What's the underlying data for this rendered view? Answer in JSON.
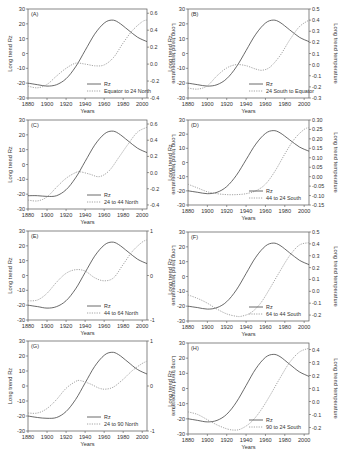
{
  "figure": {
    "x_label": "Years",
    "left_axis_label": "Long trend Rz",
    "right_axis_label": "Long trend temperature",
    "rz_legend": "Rz"
  },
  "colors": {
    "axis": "#555555",
    "rz_line": "#444444",
    "temp_line": "#9a9a9a",
    "text": "#333333"
  },
  "chart_data": [
    {
      "panel": "(A)",
      "type": "line",
      "title": "",
      "region": "Equator to 24 North",
      "xlabel": "Years",
      "ylabel": "Long trend Rz",
      "y2label": "Long trend temperature",
      "x_ticks": [
        1880,
        1900,
        1920,
        1940,
        1960,
        1980,
        2000
      ],
      "xlim": [
        1880,
        2005
      ],
      "y_ticks": [
        -30,
        -20,
        -10,
        0,
        10,
        20,
        30
      ],
      "ylim": [
        -30,
        30
      ],
      "y2_ticks": [
        -0.4,
        -0.2,
        0.0,
        0.2,
        0.4,
        0.6
      ],
      "y2lim": [
        -0.4,
        0.65
      ],
      "legend": [
        "Rz",
        "Equator to 24 North"
      ],
      "legend_position": "lower right",
      "series": [
        {
          "name": "Rz",
          "axis": "left",
          "style": "solid",
          "x": [
            1880,
            1890,
            1900,
            1910,
            1920,
            1930,
            1940,
            1950,
            1960,
            1968,
            1975,
            1985,
            1995,
            2005
          ],
          "y": [
            -20,
            -21,
            -22,
            -21,
            -17,
            -9,
            2,
            13,
            20.5,
            22.5,
            21,
            16,
            11,
            8
          ]
        },
        {
          "name": "Equator to 24 North",
          "axis": "right",
          "style": "dotted",
          "x": [
            1880,
            1890,
            1900,
            1910,
            1920,
            1930,
            1940,
            1950,
            1960,
            1970,
            1980,
            1990,
            2000,
            2005
          ],
          "y": [
            -0.26,
            -0.28,
            -0.24,
            -0.14,
            -0.05,
            0.01,
            0.0,
            -0.02,
            -0.01,
            0.08,
            0.25,
            0.4,
            0.5,
            0.52
          ]
        }
      ]
    },
    {
      "panel": "(B)",
      "type": "line",
      "title": "",
      "region": "24 South to Equator",
      "xlabel": "Years",
      "ylabel": "Long trend Rz",
      "y2label": "Long trend temperature",
      "x_ticks": [
        1880,
        1900,
        1920,
        1940,
        1960,
        1980,
        2000
      ],
      "xlim": [
        1880,
        2005
      ],
      "y_ticks": [
        -30,
        -20,
        -10,
        0,
        10,
        20,
        30
      ],
      "ylim": [
        -30,
        30
      ],
      "y2_ticks": [
        -0.3,
        -0.2,
        -0.1,
        0.0,
        0.1,
        0.2,
        0.3,
        0.4,
        0.5
      ],
      "y2lim": [
        -0.3,
        0.5
      ],
      "legend": [
        "Rz",
        "24 South to Equator"
      ],
      "legend_position": "lower right",
      "series": [
        {
          "name": "Rz",
          "axis": "left",
          "style": "solid",
          "x": [
            1880,
            1890,
            1900,
            1910,
            1920,
            1930,
            1940,
            1950,
            1960,
            1968,
            1975,
            1985,
            1995,
            2005
          ],
          "y": [
            -20,
            -21,
            -22,
            -21,
            -17,
            -9,
            2,
            13,
            20.5,
            22.5,
            21,
            16,
            11,
            8
          ]
        },
        {
          "name": "24 South to Equator",
          "axis": "right",
          "style": "dotted",
          "x": [
            1880,
            1890,
            1900,
            1910,
            1920,
            1930,
            1940,
            1950,
            1957,
            1965,
            1975,
            1985,
            1995,
            2005
          ],
          "y": [
            -0.21,
            -0.22,
            -0.19,
            -0.1,
            -0.03,
            0.0,
            -0.01,
            -0.04,
            -0.05,
            -0.02,
            0.08,
            0.22,
            0.34,
            0.4
          ]
        }
      ]
    },
    {
      "panel": "(C)",
      "type": "line",
      "title": "",
      "region": "24 to 44 North",
      "xlabel": "Years",
      "ylabel": "Long trend Rz",
      "y2label": "Long trend temperature",
      "x_ticks": [
        1880,
        1900,
        1920,
        1940,
        1960,
        1980,
        2000
      ],
      "xlim": [
        1880,
        2005
      ],
      "y_ticks": [
        -30,
        -20,
        -10,
        0,
        10,
        20,
        30
      ],
      "ylim": [
        -30,
        30
      ],
      "y2_ticks": [
        -0.4,
        -0.2,
        0.0,
        0.2,
        0.4,
        0.6
      ],
      "y2lim": [
        -0.45,
        0.65
      ],
      "legend": [
        "Rz",
        "24 to 44 North"
      ],
      "legend_position": "lower right",
      "series": [
        {
          "name": "Rz",
          "axis": "left",
          "style": "solid",
          "x": [
            1880,
            1890,
            1900,
            1910,
            1920,
            1930,
            1940,
            1950,
            1960,
            1968,
            1975,
            1985,
            1995,
            2005
          ],
          "y": [
            -21,
            -21,
            -21.5,
            -21,
            -17,
            -9,
            2,
            13,
            20.5,
            22.5,
            21,
            16,
            11,
            8
          ]
        },
        {
          "name": "24 to 44 North",
          "axis": "right",
          "style": "dotted",
          "x": [
            1880,
            1890,
            1900,
            1910,
            1920,
            1930,
            1935,
            1945,
            1955,
            1965,
            1975,
            1985,
            1995,
            2005
          ],
          "y": [
            -0.34,
            -0.35,
            -0.3,
            -0.18,
            -0.07,
            0.0,
            0.01,
            -0.02,
            -0.05,
            0.02,
            0.18,
            0.35,
            0.5,
            0.56
          ]
        }
      ]
    },
    {
      "panel": "(D)",
      "type": "line",
      "title": "",
      "region": "44 to 24 South",
      "xlabel": "Years",
      "ylabel": "Long trend Rz",
      "y2label": "Long trend temperature",
      "x_ticks": [
        1880,
        1900,
        1920,
        1940,
        1960,
        1980,
        2000
      ],
      "xlim": [
        1880,
        2005
      ],
      "y_ticks": [
        -30,
        -20,
        -10,
        0,
        10,
        20,
        30
      ],
      "ylim": [
        -30,
        30
      ],
      "y2_ticks": [
        -0.15,
        -0.1,
        -0.05,
        0.0,
        0.05,
        0.1,
        0.15,
        0.2,
        0.25,
        0.3
      ],
      "y2lim": [
        -0.15,
        0.3
      ],
      "legend": [
        "Rz",
        "44 to 24 South"
      ],
      "legend_position": "lower right",
      "series": [
        {
          "name": "Rz",
          "axis": "left",
          "style": "solid",
          "x": [
            1880,
            1890,
            1900,
            1910,
            1920,
            1930,
            1940,
            1950,
            1960,
            1968,
            1975,
            1985,
            1995,
            2005
          ],
          "y": [
            -20,
            -21,
            -22,
            -21,
            -17,
            -9,
            2,
            13,
            20.5,
            22.5,
            21,
            16,
            11,
            8
          ]
        },
        {
          "name": "44 to 24 South",
          "axis": "right",
          "style": "dotted",
          "x": [
            1880,
            1890,
            1900,
            1910,
            1920,
            1930,
            1940,
            1950,
            1960,
            1970,
            1980,
            1990,
            2000,
            2005
          ],
          "y": [
            -0.04,
            -0.06,
            -0.08,
            -0.09,
            -0.095,
            -0.095,
            -0.09,
            -0.075,
            -0.04,
            0.03,
            0.12,
            0.2,
            0.25,
            0.26
          ]
        }
      ]
    },
    {
      "panel": "(E)",
      "type": "line",
      "title": "",
      "region": "44 to 64 North",
      "xlabel": "Years",
      "ylabel": "Long trend Rz",
      "y2label": "Long trend temperature",
      "x_ticks": [
        1880,
        1900,
        1920,
        1940,
        1960,
        1980,
        2000
      ],
      "xlim": [
        1880,
        2005
      ],
      "y_ticks": [
        -30,
        -20,
        -10,
        0,
        10,
        20,
        30
      ],
      "ylim": [
        -30,
        30
      ],
      "y2_ticks": [
        -1,
        0,
        1
      ],
      "y2lim": [
        -1,
        1
      ],
      "legend": [
        "Rz",
        "44 to 64 North"
      ],
      "legend_position": "lower right",
      "series": [
        {
          "name": "Rz",
          "axis": "left",
          "style": "solid",
          "x": [
            1880,
            1890,
            1900,
            1910,
            1920,
            1930,
            1940,
            1950,
            1960,
            1968,
            1975,
            1985,
            1995,
            2005
          ],
          "y": [
            -20,
            -21,
            -22,
            -21,
            -17,
            -9,
            2,
            13,
            20.5,
            22.5,
            21,
            16,
            11,
            8
          ]
        },
        {
          "name": "44 to 64 North",
          "axis": "right",
          "style": "dotted",
          "x": [
            1880,
            1890,
            1900,
            1910,
            1920,
            1930,
            1940,
            1950,
            1960,
            1970,
            1980,
            1990,
            2000,
            2005
          ],
          "y": [
            -0.57,
            -0.55,
            -0.4,
            -0.15,
            0.05,
            0.13,
            0.1,
            -0.05,
            -0.12,
            -0.05,
            0.25,
            0.55,
            0.75,
            0.8
          ]
        }
      ]
    },
    {
      "panel": "(F)",
      "type": "line",
      "title": "",
      "region": "64 to 44 South",
      "xlabel": "Years",
      "ylabel": "Long trend Rz",
      "y2label": "Long trend temperature",
      "x_ticks": [
        1880,
        1900,
        1920,
        1940,
        1960,
        1980,
        2000
      ],
      "xlim": [
        1880,
        2005
      ],
      "y_ticks": [
        -30,
        -20,
        -10,
        0,
        10,
        20,
        30
      ],
      "ylim": [
        -30,
        30
      ],
      "y2_ticks": [
        -0.2,
        -0.1,
        0.0,
        0.1,
        0.2,
        0.3,
        0.4,
        0.5
      ],
      "y2lim": [
        -0.25,
        0.5
      ],
      "legend": [
        "Rz",
        "64 to 44 South"
      ],
      "legend_position": "lower right",
      "series": [
        {
          "name": "Rz",
          "axis": "left",
          "style": "solid",
          "x": [
            1880,
            1890,
            1900,
            1910,
            1920,
            1930,
            1940,
            1950,
            1960,
            1968,
            1975,
            1985,
            1995,
            2005
          ],
          "y": [
            -20,
            -21,
            -22,
            -21,
            -17,
            -9,
            2,
            13,
            20.5,
            22.5,
            21,
            16,
            11,
            8
          ]
        },
        {
          "name": "64 to 44 South",
          "axis": "right",
          "style": "dotted",
          "x": [
            1880,
            1890,
            1900,
            1910,
            1920,
            1930,
            1935,
            1945,
            1955,
            1965,
            1975,
            1985,
            1995,
            2005
          ],
          "y": [
            -0.03,
            -0.06,
            -0.1,
            -0.15,
            -0.19,
            -0.21,
            -0.21,
            -0.18,
            -0.1,
            0.03,
            0.17,
            0.3,
            0.39,
            0.41
          ]
        }
      ]
    },
    {
      "panel": "(G)",
      "type": "line",
      "title": "",
      "region": "24 to 90 North",
      "xlabel": "Years",
      "ylabel": "Long trend Rz",
      "y2label": "Long trend temperature",
      "x_ticks": [
        1880,
        1900,
        1920,
        1940,
        1960,
        1980,
        2000
      ],
      "xlim": [
        1880,
        2005
      ],
      "y_ticks": [
        -30,
        -20,
        -10,
        0,
        10,
        20,
        30
      ],
      "ylim": [
        -30,
        30
      ],
      "y2_ticks": [
        -1,
        0,
        1
      ],
      "y2lim": [
        -1,
        1
      ],
      "legend": [
        "Rz",
        "24 to 90 North"
      ],
      "legend_position": "lower right",
      "series": [
        {
          "name": "Rz",
          "axis": "left",
          "style": "solid",
          "x": [
            1880,
            1890,
            1900,
            1910,
            1920,
            1930,
            1940,
            1950,
            1960,
            1968,
            1975,
            1985,
            1995,
            2005
          ],
          "y": [
            -20,
            -21,
            -21.5,
            -21,
            -17,
            -9,
            2,
            13,
            20.5,
            22.5,
            21,
            16,
            11,
            8
          ]
        },
        {
          "name": "24 to 90 North",
          "axis": "right",
          "style": "dotted",
          "x": [
            1880,
            1890,
            1900,
            1910,
            1920,
            1930,
            1935,
            1945,
            1955,
            1962,
            1970,
            1980,
            1990,
            2000,
            2005
          ],
          "y": [
            -0.6,
            -0.6,
            -0.5,
            -0.3,
            -0.05,
            0.1,
            0.12,
            0.05,
            -0.05,
            -0.07,
            -0.02,
            0.15,
            0.35,
            0.5,
            0.55
          ]
        }
      ]
    },
    {
      "panel": "(H)",
      "type": "line",
      "title": "",
      "region": "90 to 24 South",
      "xlabel": "Years",
      "ylabel": "Long trend Rz",
      "y2label": "Long trend temperature",
      "x_ticks": [
        1880,
        1900,
        1920,
        1940,
        1960,
        1980,
        2000
      ],
      "xlim": [
        1880,
        2005
      ],
      "y_ticks": [
        -30,
        -20,
        -10,
        0,
        10,
        20,
        30
      ],
      "ylim": [
        -30,
        30
      ],
      "y2_ticks": [
        -0.2,
        -0.1,
        0.0,
        0.1,
        0.2,
        0.3,
        0.4
      ],
      "y2lim": [
        -0.25,
        0.45
      ],
      "legend": [
        "Rz",
        "90 to 24 South"
      ],
      "legend_position": "lower right",
      "series": [
        {
          "name": "Rz",
          "axis": "left",
          "style": "solid",
          "x": [
            1880,
            1890,
            1900,
            1910,
            1920,
            1930,
            1940,
            1950,
            1960,
            1968,
            1975,
            1985,
            1995,
            2005
          ],
          "y": [
            -20,
            -21,
            -22,
            -21,
            -17,
            -9,
            2,
            13,
            20.5,
            22.5,
            21,
            16,
            11,
            8
          ]
        },
        {
          "name": "90 to 24 South",
          "axis": "right",
          "style": "dotted",
          "x": [
            1880,
            1890,
            1900,
            1910,
            1920,
            1928,
            1935,
            1945,
            1955,
            1965,
            1975,
            1985,
            1995,
            2005
          ],
          "y": [
            -0.08,
            -0.1,
            -0.14,
            -0.18,
            -0.21,
            -0.22,
            -0.21,
            -0.16,
            -0.07,
            0.05,
            0.18,
            0.3,
            0.38,
            0.41
          ]
        }
      ]
    }
  ]
}
